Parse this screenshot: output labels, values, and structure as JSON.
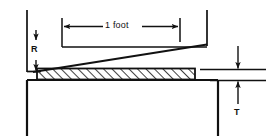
{
  "diagram": {
    "type": "engineering-section-drawing",
    "labels": {
      "span": "1 foot",
      "gap": "R",
      "thickness": "T"
    },
    "icons": {
      "span_dimension": "double-headed-horizontal-arrow",
      "gap_dimension": "down-arrow",
      "thickness_dimension": "vertical-double-arrow"
    },
    "colors": {
      "line": "#111111",
      "background": "#ffffff",
      "hatch": "#111111"
    },
    "geometry": {
      "left_wall_x": 27,
      "right_wall_x": 207,
      "slab_top_y": 69,
      "slab_bottom_y": 79,
      "base_top_y": 80,
      "straightedge_start": [
        35,
        71
      ],
      "straightedge_end": [
        207,
        44
      ]
    },
    "notes": {
      "span_value": "1",
      "span_unit": "foot",
      "gap_symbol": "R",
      "thickness_symbol": "T"
    }
  }
}
